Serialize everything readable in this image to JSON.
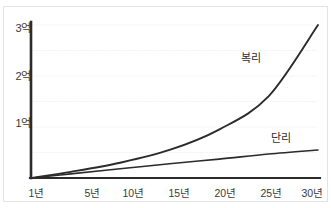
{
  "clipped_caption": "",
  "chart_data": {
    "type": "line",
    "title": "",
    "subtitle": "",
    "xlabel": "",
    "ylabel": "",
    "grid": true,
    "legend_position": "inline-right",
    "x": [
      1,
      5,
      10,
      15,
      20,
      25,
      30
    ],
    "categories": [
      "1년",
      "5년",
      "10년",
      "15년",
      "20년",
      "25년",
      "30년"
    ],
    "xlim": [
      1,
      30
    ],
    "ylim": [
      0,
      3
    ],
    "y_unit": "억",
    "y_ticks": [
      1,
      2,
      3
    ],
    "y_tick_labels": [
      "1억",
      "2억",
      "3억"
    ],
    "gridline_values": [
      0.5,
      1.0,
      1.5,
      2.0,
      2.5,
      3.0
    ],
    "series": [
      {
        "name": "복리",
        "label": "복리",
        "color": "#2b2b2b",
        "values": [
          0.0,
          0.12,
          0.3,
          0.55,
          0.95,
          1.6,
          3.0
        ]
      },
      {
        "name": "단리",
        "label": "단리",
        "color": "#2b2b2b",
        "values": [
          0.0,
          0.08,
          0.18,
          0.28,
          0.37,
          0.47,
          0.55
        ]
      }
    ]
  },
  "axis": {
    "color": "#2b2b2b",
    "grid_color": "#ededed"
  }
}
